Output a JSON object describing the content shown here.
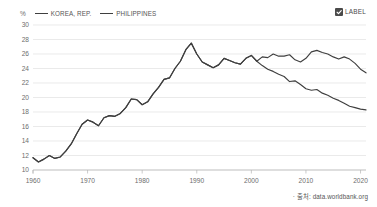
{
  "legend": {
    "unit": "%",
    "entries": [
      {
        "name": "KOREA, REP.",
        "color": "#3f3f3f"
      },
      {
        "name": "PHILIPPINES",
        "color": "#3f3f3f"
      }
    ]
  },
  "label_toggle": {
    "text": "LABEL",
    "checked": true,
    "icon": "checkbox-checked-icon"
  },
  "source": {
    "text": "· 출처: data.worldbank.org"
  },
  "chart_data": {
    "type": "line",
    "title": "",
    "subtitle": "",
    "xlabel": "",
    "ylabel": "%",
    "xlim": [
      1960,
      2021
    ],
    "ylim": [
      10,
      30
    ],
    "ytick_step": 2,
    "xtick_step": 10,
    "yticks": [
      10,
      12,
      14,
      16,
      18,
      20,
      22,
      24,
      26,
      28,
      30
    ],
    "xticks": [
      1960,
      1970,
      1980,
      1990,
      2000,
      2010,
      2020
    ],
    "grid": true,
    "legend_position": "top-left",
    "annotations": [],
    "series": [
      {
        "name": "KOREA, REP.",
        "color": "#3f3f3f",
        "x": [
          1960,
          1961,
          1962,
          1963,
          1964,
          1965,
          1966,
          1967,
          1968,
          1969,
          1970,
          1971,
          1972,
          1973,
          1974,
          1975,
          1976,
          1977,
          1978,
          1979,
          1980,
          1981,
          1982,
          1983,
          1984,
          1985,
          1986,
          1987,
          1988,
          1989,
          1990,
          1991,
          1992,
          1993,
          1994,
          1995,
          1996,
          1997,
          1998,
          1999,
          2000,
          2001,
          2002,
          2003,
          2004,
          2005,
          2006,
          2007,
          2008,
          2009,
          2010,
          2011,
          2012,
          2013,
          2014,
          2015,
          2016,
          2017,
          2018,
          2019,
          2020,
          2021
        ],
        "values": [
          11.7,
          11.1,
          11.5,
          12.0,
          11.6,
          11.8,
          12.6,
          13.6,
          15.0,
          16.3,
          16.9,
          16.6,
          16.1,
          17.2,
          17.5,
          17.4,
          17.8,
          18.6,
          19.8,
          19.7,
          19.0,
          19.4,
          20.5,
          21.4,
          22.5,
          22.7,
          24.0,
          25.0,
          26.6,
          27.5,
          26.0,
          24.9,
          24.5,
          24.1,
          24.5,
          25.4,
          25.1,
          24.8,
          24.6,
          25.4,
          25.8,
          25.0,
          25.6,
          25.5,
          26.0,
          25.7,
          25.7,
          25.9,
          25.2,
          24.9,
          25.4,
          26.3,
          26.5,
          26.2,
          26.0,
          25.6,
          25.3,
          25.6,
          25.3,
          24.7,
          23.9,
          23.4
        ]
      },
      {
        "name": "PHILIPPINES",
        "color": "#3f3f3f",
        "x": [
          1960,
          1961,
          1962,
          1963,
          1964,
          1965,
          1966,
          1967,
          1968,
          1969,
          1970,
          1971,
          1972,
          1973,
          1974,
          1975,
          1976,
          1977,
          1978,
          1979,
          1980,
          1981,
          1982,
          1983,
          1984,
          1985,
          1986,
          1987,
          1988,
          1989,
          1990,
          1991,
          1992,
          1993,
          1994,
          1995,
          1996,
          1997,
          1998,
          1999,
          2000,
          2001,
          2002,
          2003,
          2004,
          2005,
          2006,
          2007,
          2008,
          2009,
          2010,
          2011,
          2012,
          2013,
          2014,
          2015,
          2016,
          2017,
          2018,
          2019,
          2020,
          2021
        ],
        "values": [
          11.7,
          11.1,
          11.5,
          12.0,
          11.6,
          11.8,
          12.6,
          13.6,
          15.0,
          16.3,
          16.9,
          16.6,
          16.1,
          17.2,
          17.5,
          17.4,
          17.8,
          18.6,
          19.8,
          19.7,
          19.0,
          19.4,
          20.5,
          21.4,
          22.5,
          22.7,
          24.0,
          25.0,
          26.6,
          27.5,
          26.0,
          24.9,
          24.5,
          24.1,
          24.5,
          25.4,
          25.1,
          24.8,
          24.6,
          25.4,
          25.8,
          25.0,
          24.4,
          23.9,
          23.6,
          23.2,
          22.9,
          22.2,
          22.3,
          21.8,
          21.2,
          21.0,
          21.1,
          20.6,
          20.3,
          19.9,
          19.6,
          19.2,
          18.8,
          18.6,
          18.4,
          18.3
        ]
      }
    ]
  }
}
